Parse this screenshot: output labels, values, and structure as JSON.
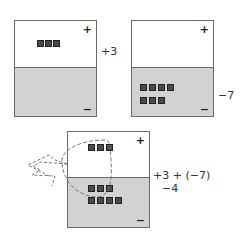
{
  "panels": [
    {
      "id": "panel-positive-3",
      "plus_sign": "+",
      "minus_sign": "−",
      "label": "+3",
      "positive_chips": 3,
      "negative_chips": 0
    },
    {
      "id": "panel-negative-7",
      "plus_sign": "+",
      "minus_sign": "−",
      "label": "−7",
      "positive_chips": 0,
      "negative_chips": 7
    },
    {
      "id": "panel-combined",
      "plus_sign": "+",
      "minus_sign": "−",
      "label_expression": "+3 + (−7)",
      "label_result": "−4",
      "positive_chips": 3,
      "negative_chips": 7,
      "zero_pairs_removed": 3
    }
  ],
  "annotation": {
    "type": "dashed-loop-arrow",
    "meaning": "remove zero pairs"
  },
  "colors": {
    "chip": "#4a4a4a",
    "negative_region": "#d2d2d2",
    "positive_region": "#ffffff",
    "border": "#6a6a6a",
    "dashed": "#777777"
  }
}
